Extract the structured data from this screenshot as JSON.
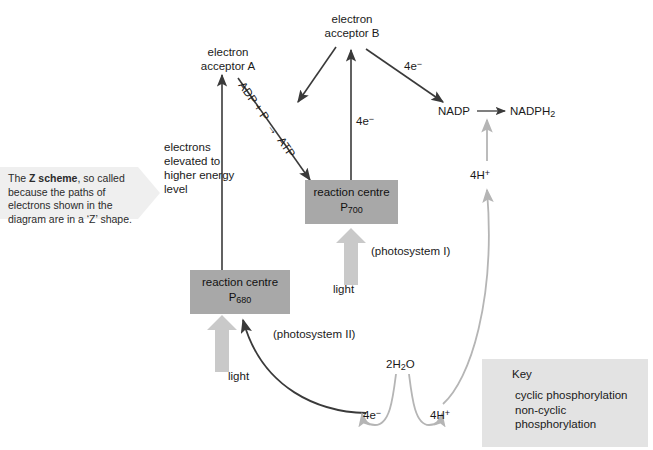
{
  "diagram": {
    "annotation": {
      "lead": "The ",
      "bold": "Z scheme",
      "rest": ", so called because the paths of electrons shown in the diagram are in a ‘Z’ shape."
    },
    "nodes": {
      "electron_acceptor_a": "electron\nacceptor A",
      "electron_acceptor_b": "electron\nacceptor B",
      "reaction_centre_700_line1": "reaction centre",
      "reaction_centre_700_line2": "P",
      "reaction_centre_700_sub": "700",
      "reaction_centre_680_line1": "reaction centre",
      "reaction_centre_680_line2": "P",
      "reaction_centre_680_sub": "680",
      "nadp": "NADP",
      "nadph2": "NADPH",
      "nadph2_sub": "2",
      "water": "2H",
      "water_sub": "2",
      "water_tail": "O"
    },
    "labels": {
      "electrons_elevated": "electrons\nelevated to\nhigher energy\nlevel",
      "adp_atp": "ADP + P  →  ATP",
      "four_e_b_to_nadp": "4e",
      "four_e_b_to_nadp_sup": "−",
      "four_e_p700_to_b": "4e",
      "four_e_p700_to_b_sup": "−",
      "four_e_water": "4e",
      "four_e_water_sup": "−",
      "four_h_plus_lower": "4H",
      "four_h_plus_lower_sup": "+",
      "four_h_plus_upper": "4H",
      "four_h_plus_upper_sup": "+",
      "light_ps1": "light",
      "light_ps2": "light",
      "photosystem_1": "(photosystem I)",
      "photosystem_2": "(photosystem II)"
    },
    "key": {
      "title": "Key",
      "entries": [
        {
          "label": "cyclic phosphorylation",
          "color": "#3a3a3a"
        },
        {
          "label": "non-cyclic\nphosphorylation",
          "color": "#8c8c8c"
        }
      ]
    },
    "colors": {
      "dark_arrow": "#3a3a3a",
      "light_arrow": "#b5b5b5",
      "box_fill": "#a8a8a8",
      "key_fill": "#e3e3e3",
      "callout_fill": "#efefef",
      "background": "#ffffff",
      "text": "#1a1a1a"
    }
  }
}
